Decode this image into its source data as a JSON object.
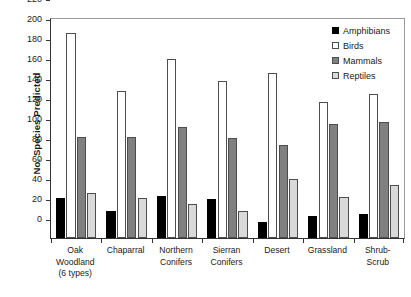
{
  "chart_data": {
    "type": "bar",
    "title": "",
    "subtitle": "",
    "xlabel": "",
    "ylabel": "No. Species Predicted",
    "ylim": [
      0,
      220
    ],
    "ytick_step": 20,
    "yticks": [
      0,
      20,
      40,
      60,
      80,
      100,
      120,
      140,
      160,
      180,
      200,
      220
    ],
    "grid": false,
    "legend_position": "top-right",
    "categories": [
      "Oak Woodland (6 types)",
      "Chaparral",
      "Northern Conifers",
      "Sierran Conifers",
      "Desert",
      "Grassland",
      "Shrub-Scrub"
    ],
    "category_label_lines": [
      [
        "Oak",
        "Woodland",
        "(6 types)"
      ],
      [
        "Chaparral"
      ],
      [
        "Northern",
        "Conifers"
      ],
      [
        "Sierran",
        "Conifers"
      ],
      [
        "Desert"
      ],
      [
        "Grassland"
      ],
      [
        "Shrub-",
        "Scrub"
      ]
    ],
    "series": [
      {
        "name": "Amphibians",
        "key": "amphibians",
        "color": "#000000",
        "values": [
          40,
          27,
          42,
          39,
          16,
          22,
          24
        ]
      },
      {
        "name": "Birds",
        "key": "birds",
        "color": "#ffffff",
        "values": [
          205,
          147,
          179,
          157,
          165,
          136,
          144
        ]
      },
      {
        "name": "Mammals",
        "key": "mammals",
        "color": "#808080",
        "values": [
          101,
          101,
          111,
          100,
          93,
          114,
          116
        ]
      },
      {
        "name": "Reptiles",
        "key": "reptiles",
        "color": "#d9d9d9",
        "values": [
          45,
          40,
          34,
          27,
          59,
          41,
          53
        ]
      }
    ]
  },
  "legend": {
    "items": [
      {
        "label": "Amphibians",
        "key": "amphibians"
      },
      {
        "label": "Birds",
        "key": "birds"
      },
      {
        "label": "Mammals",
        "key": "mammals"
      },
      {
        "label": "Reptiles",
        "key": "reptiles"
      }
    ]
  },
  "axis": {
    "y_title": "No. Species Predicted"
  }
}
